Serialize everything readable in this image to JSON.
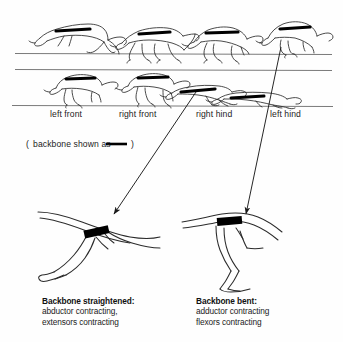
{
  "figure": {
    "title_absent": true,
    "background_color": "#fefefe",
    "ink_color": "#1a1a1a",
    "backbone_color": "#000000"
  },
  "gait_labels": [
    {
      "text": "left front",
      "x": 50,
      "y": 113
    },
    {
      "text": "right front",
      "x": 119,
      "y": 113
    },
    {
      "text": "right hind",
      "x": 196,
      "y": 113
    },
    {
      "text": "left hind",
      "x": 270,
      "y": 113
    }
  ],
  "legend": {
    "open_paren": "(",
    "text": "backbone shown as",
    "close_paren": ")",
    "dash_symbol": "—",
    "x": 26,
    "y": 140
  },
  "sequence": {
    "rows": [
      {
        "name": "upper-row",
        "ground_y": 53,
        "dogs": [
          {
            "pose": "gallop-extended",
            "x": 38,
            "y": 18
          },
          {
            "pose": "gallop-gathered",
            "x": 118,
            "y": 18
          },
          {
            "pose": "gallop-contracted",
            "x": 190,
            "y": 16
          },
          {
            "pose": "gallop-landing",
            "x": 262,
            "y": 14
          }
        ]
      },
      {
        "name": "lower-row",
        "ground_y": 106,
        "dogs": [
          {
            "pose": "stance-left-front",
            "x": 46,
            "y": 70
          },
          {
            "pose": "stance-right-front",
            "x": 118,
            "y": 68
          },
          {
            "pose": "stretch-right-hind",
            "x": 183,
            "y": 78
          },
          {
            "pose": "stretch-left-hind",
            "x": 258,
            "y": 82
          }
        ]
      }
    ]
  },
  "arrows": [
    {
      "name": "arrow-left",
      "from": {
        "x": 196,
        "y": 92
      },
      "to": {
        "x": 112,
        "y": 216
      },
      "source_label": "right hind",
      "target": "left-leg-diagram"
    },
    {
      "name": "arrow-right",
      "from": {
        "x": 281,
        "y": 47
      },
      "to": {
        "x": 245,
        "y": 216
      },
      "source_label": "left hind",
      "target": "right-leg-diagram"
    }
  ],
  "diagrams": [
    {
      "name": "left-leg-diagram",
      "state": "straightened",
      "backbone_bar": {
        "x": 86,
        "y": 232,
        "w": 22,
        "h": 7,
        "angle": -12
      }
    },
    {
      "name": "right-leg-diagram",
      "state": "bent",
      "backbone_bar": {
        "x": 222,
        "y": 220,
        "w": 22,
        "h": 7,
        "angle": -4
      }
    }
  ],
  "captions": [
    {
      "name": "caption-left",
      "title": "Backbone straightened:",
      "lines": [
        "abductor contracting,",
        "extensors contracting"
      ],
      "x": 42,
      "y": 300
    },
    {
      "name": "caption-right",
      "title": "Backbone bent:",
      "lines": [
        "adductor contracting",
        "flexors contracting"
      ],
      "x": 196,
      "y": 300
    }
  ]
}
